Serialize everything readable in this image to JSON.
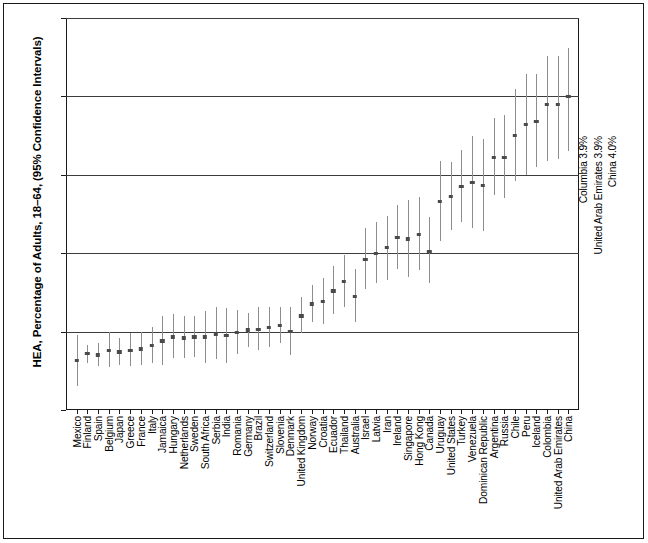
{
  "chart_data": {
    "type": "scatter",
    "title": "",
    "xlabel": "",
    "ylabel": "HEA, Percentage of Adults, 18–64, (95% Confidence Intervals)",
    "ylim": [
      0,
      5
    ],
    "yticks": [
      "0%",
      "1%",
      "2%",
      "3%",
      "4%",
      "5%"
    ],
    "ytick_values": [
      0,
      1,
      2,
      3,
      4,
      5
    ],
    "grid": true,
    "legend": "none",
    "error_bar_note": "95% Confidence Intervals shown as vertical whiskers",
    "categories": [
      "Mexico",
      "Finland",
      "Spain",
      "Belgium",
      "Japan",
      "Greece",
      "France",
      "Italy",
      "Jamaica",
      "Hungary",
      "Netherlands",
      "Sweden",
      "South Africa",
      "Serbia",
      "India",
      "Romania",
      "Germany",
      "Brazil",
      "Switzerland",
      "Slovenia",
      "Denmark",
      "United Kingdom",
      "Norway",
      "Croatia",
      "Ecuador",
      "Thailand",
      "Australia",
      "Israel",
      "Latvia",
      "Iran",
      "Ireland",
      "Singapore",
      "Hong Kong",
      "Canada",
      "Uruguay",
      "United States",
      "Turkey",
      "Venezuela",
      "Dominican Republic",
      "Argentina",
      "Russia",
      "Chile",
      "Peru",
      "Iceland",
      "Colombia",
      "United Arab Emirates",
      "China"
    ],
    "values": [
      0.63,
      0.72,
      0.7,
      0.76,
      0.74,
      0.76,
      0.78,
      0.82,
      0.88,
      0.93,
      0.92,
      0.93,
      0.93,
      0.97,
      0.95,
      0.99,
      1.02,
      1.03,
      1.05,
      1.08,
      1.0,
      1.2,
      1.35,
      1.38,
      1.52,
      1.64,
      1.45,
      1.92,
      2.0,
      2.07,
      2.2,
      2.18,
      2.24,
      2.02,
      2.66,
      2.72,
      2.85,
      2.9,
      2.86,
      3.22,
      3.22,
      3.5,
      3.64,
      3.68,
      3.9,
      3.9,
      4.0
    ],
    "ci_low": [
      0.3,
      0.6,
      0.56,
      0.55,
      0.57,
      0.56,
      0.57,
      0.6,
      0.58,
      0.66,
      0.66,
      0.68,
      0.6,
      0.65,
      0.6,
      0.72,
      0.8,
      0.76,
      0.8,
      0.85,
      0.7,
      0.98,
      1.12,
      1.1,
      1.22,
      1.32,
      1.12,
      1.54,
      1.62,
      1.66,
      1.8,
      1.7,
      1.78,
      1.62,
      2.16,
      2.3,
      2.4,
      2.32,
      2.28,
      2.74,
      2.7,
      2.92,
      3.0,
      3.1,
      3.18,
      3.2,
      3.3
    ],
    "ci_high": [
      0.96,
      0.83,
      0.86,
      1.0,
      0.92,
      0.98,
      1.0,
      1.06,
      1.2,
      1.22,
      1.2,
      1.2,
      1.26,
      1.32,
      1.3,
      1.28,
      1.24,
      1.32,
      1.32,
      1.32,
      1.32,
      1.44,
      1.6,
      1.68,
      1.84,
      1.98,
      1.8,
      2.32,
      2.4,
      2.48,
      2.62,
      2.68,
      2.72,
      2.46,
      3.18,
      3.16,
      3.32,
      3.5,
      3.46,
      3.72,
      3.76,
      4.1,
      4.28,
      4.28,
      4.52,
      4.52,
      4.62
    ],
    "annotations": [
      "Columbia 3.9%",
      "United Arab Emirates 3.9%",
      "China 4.0%"
    ]
  }
}
